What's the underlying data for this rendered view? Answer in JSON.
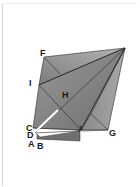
{
  "diagram": {
    "type": "origami-fold-geometry",
    "colors": {
      "fill_dark": "#7a7a7a",
      "fill_mid": "#8e8e8e",
      "fill_light": "#a6a6a6",
      "stroke": "#2a2a2a",
      "crease_white": "#ffffff"
    },
    "points": {
      "apex": [
        125,
        48
      ],
      "F": [
        44,
        57
      ],
      "I": [
        39,
        85
      ],
      "H": [
        60,
        110
      ],
      "C": [
        33,
        128
      ],
      "D": [
        36,
        133
      ],
      "A": [
        35,
        136
      ],
      "B": [
        40,
        137
      ],
      "J": [
        81,
        130
      ],
      "G": [
        108,
        130
      ]
    },
    "labels": [
      {
        "id": "F",
        "text": "F",
        "x": 40,
        "y": 56
      },
      {
        "id": "I",
        "text": "I",
        "x": 29,
        "y": 86
      },
      {
        "id": "H",
        "text": "H",
        "x": 62,
        "y": 98
      },
      {
        "id": "C",
        "text": "C",
        "x": 26,
        "y": 131
      },
      {
        "id": "D",
        "text": "D",
        "x": 27,
        "y": 138
      },
      {
        "id": "A",
        "text": "A",
        "x": 28,
        "y": 147
      },
      {
        "id": "B",
        "text": "B",
        "x": 37,
        "y": 149
      },
      {
        "id": "J",
        "text": "J",
        "x": 78,
        "y": 131
      },
      {
        "id": "G",
        "text": "G",
        "x": 109,
        "y": 136
      }
    ]
  }
}
